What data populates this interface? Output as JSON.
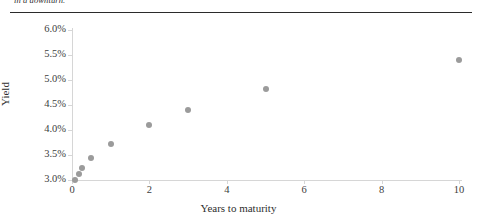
{
  "caption": {
    "clipped_text": "in a downturn."
  },
  "chart_data": {
    "type": "scatter",
    "title": "",
    "xlabel": "Years to maturity",
    "ylabel": "Yield",
    "xlim": [
      0,
      10
    ],
    "ylim": [
      3.0,
      6.0
    ],
    "xticks": [
      0,
      2,
      4,
      6,
      8,
      10
    ],
    "xticklabels": [
      "0",
      "2",
      "4",
      "6",
      "8",
      "10"
    ],
    "yticks": [
      3.0,
      3.5,
      4.0,
      4.5,
      5.0,
      5.5,
      6.0
    ],
    "yticklabels": [
      "3.0%",
      "3.5%",
      "4.0%",
      "4.5%",
      "5.0%",
      "5.5%",
      "6.0%"
    ],
    "grid": false,
    "legend": false,
    "marker_color": "#9b9b9b",
    "axis_color": "#d6d6d6",
    "points": [
      {
        "x": 0.08,
        "y": 3.0
      },
      {
        "x": 0.17,
        "y": 3.12
      },
      {
        "x": 0.25,
        "y": 3.24
      },
      {
        "x": 0.5,
        "y": 3.44
      },
      {
        "x": 1.0,
        "y": 3.72
      },
      {
        "x": 2.0,
        "y": 4.1
      },
      {
        "x": 3.0,
        "y": 4.4
      },
      {
        "x": 5.0,
        "y": 4.82
      },
      {
        "x": 10.0,
        "y": 5.4
      }
    ],
    "x": [
      0.08,
      0.17,
      0.25,
      0.5,
      1.0,
      2.0,
      3.0,
      5.0,
      10.0
    ],
    "values": [
      3.0,
      3.12,
      3.24,
      3.44,
      3.72,
      4.1,
      4.4,
      4.82,
      5.4
    ]
  }
}
